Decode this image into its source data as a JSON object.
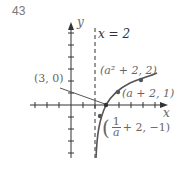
{
  "figure": {
    "problem_number": "43",
    "axis_labels": {
      "x": "x",
      "y": "y"
    },
    "asymptote_label": "x = 2",
    "asymptote_x": 2,
    "points": [
      {
        "label": "(3, 0)",
        "x": 3,
        "y": 0
      },
      {
        "label": "(a² + 2, 2)",
        "x": "a^2+2",
        "y": 2
      },
      {
        "label": "(a + 2, 1)",
        "x": "a+2",
        "y": 1
      },
      {
        "label": "(1/a + 2, −1)",
        "x": "1/a+2",
        "y": -1
      }
    ],
    "frac_label": {
      "open": "(",
      "numerator": "1",
      "denominator": "a",
      "rest": "+ 2, −1)"
    },
    "colors": {
      "curve": "#555555",
      "axis": "#333333",
      "text": "#666666"
    }
  }
}
